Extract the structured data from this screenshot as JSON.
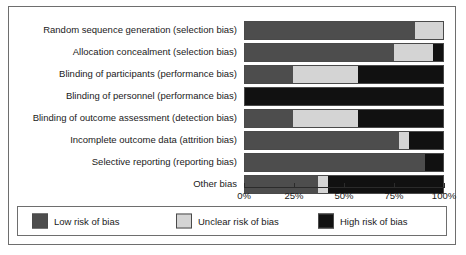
{
  "chart_data": {
    "type": "bar",
    "title": "",
    "subtitle": "",
    "xlabel": "",
    "ylabel": "",
    "orientation": "horizontal",
    "stacked": true,
    "percent": true,
    "xlim": [
      0,
      100
    ],
    "grid": false,
    "legend_position": "bottom",
    "tick_labels": [
      "0%",
      "25%",
      "50%",
      "75%",
      "100%"
    ],
    "tick_values": [
      0,
      25,
      50,
      75,
      100
    ],
    "categories": [
      "Random sequence generation (selection bias)",
      "Allocation concealment (selection bias)",
      "Blinding of participants (performance bias)",
      "Blinding of personnel (performance bias)",
      "Blinding of outcome assessment (detection bias)",
      "Incomplete outcome data (attrition bias)",
      "Selective reporting (reporting bias)",
      "Other bias"
    ],
    "series": [
      {
        "name": "Low risk of bias",
        "color": "#4d4d4d",
        "values": [
          86,
          75,
          24,
          0,
          24,
          78,
          91,
          37
        ]
      },
      {
        "name": "Unclear risk of bias",
        "color": "#d4d4d4",
        "values": [
          14,
          20,
          33,
          0,
          33,
          5,
          0,
          5
        ]
      },
      {
        "name": "High risk of bias",
        "color": "#111111",
        "values": [
          0,
          5,
          43,
          100,
          43,
          17,
          9,
          58
        ]
      }
    ]
  },
  "legend": {
    "items": [
      {
        "label": "Low risk of bias",
        "color": "#4d4d4d"
      },
      {
        "label": "Unclear risk of bias",
        "color": "#d4d4d4"
      },
      {
        "label": "High risk of bias",
        "color": "#111111"
      }
    ]
  }
}
